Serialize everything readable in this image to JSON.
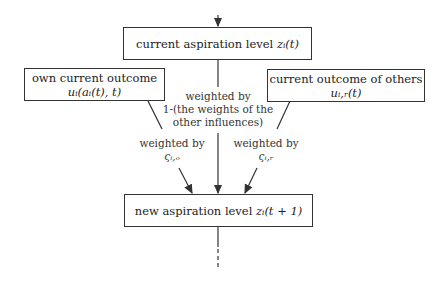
{
  "nodes": {
    "current": {
      "text": "current aspiration level",
      "math": "zᵢ(t)"
    },
    "own": {
      "line1": "own current outcome",
      "math": "uᵢ(aᵢ(t), t)"
    },
    "others": {
      "line1": "current outcome of others",
      "math": "uᵢ,ᵣ(t)"
    },
    "next": {
      "text": "new aspiration level",
      "math": "zᵢ(t + 1)"
    }
  },
  "edges": {
    "center": {
      "line1": "weighted by",
      "line2": "1-(the weights of the",
      "line3": "other influences)"
    },
    "left": {
      "line1": "weighted by",
      "line2": "ςᵢ,ₒ"
    },
    "right": {
      "line1": "weighted by",
      "line2": "ςᵢ,ᵣ"
    }
  },
  "colors": {
    "stroke": "#333333",
    "background": "#ffffff"
  }
}
